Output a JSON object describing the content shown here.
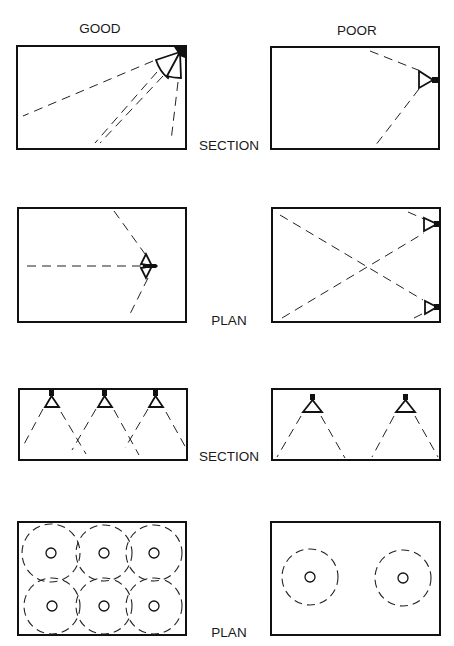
{
  "columns": {
    "good": "GOOD",
    "poor": "POOR"
  },
  "rows": [
    {
      "view": "SECTION",
      "good": "Single speaker cluster in upper corner aiming down across room",
      "poor": "Single speaker on right wall, limited coverage"
    },
    {
      "view": "PLAN",
      "good": "Single speaker cluster on wall covering room",
      "poor": "Two speakers on right wall crossing coverage"
    },
    {
      "view": "SECTION",
      "good": "Three ceiling speakers with overlapping cones",
      "poor": "Two ceiling speakers with gaps in coverage"
    },
    {
      "view": "PLAN",
      "good": "Six overlapping coverage circles",
      "poor": "Two isolated coverage circles"
    }
  ],
  "labels": {
    "row1": "SECTION",
    "row2": "PLAN",
    "row3": "SECTION",
    "row4": "PLAN"
  }
}
